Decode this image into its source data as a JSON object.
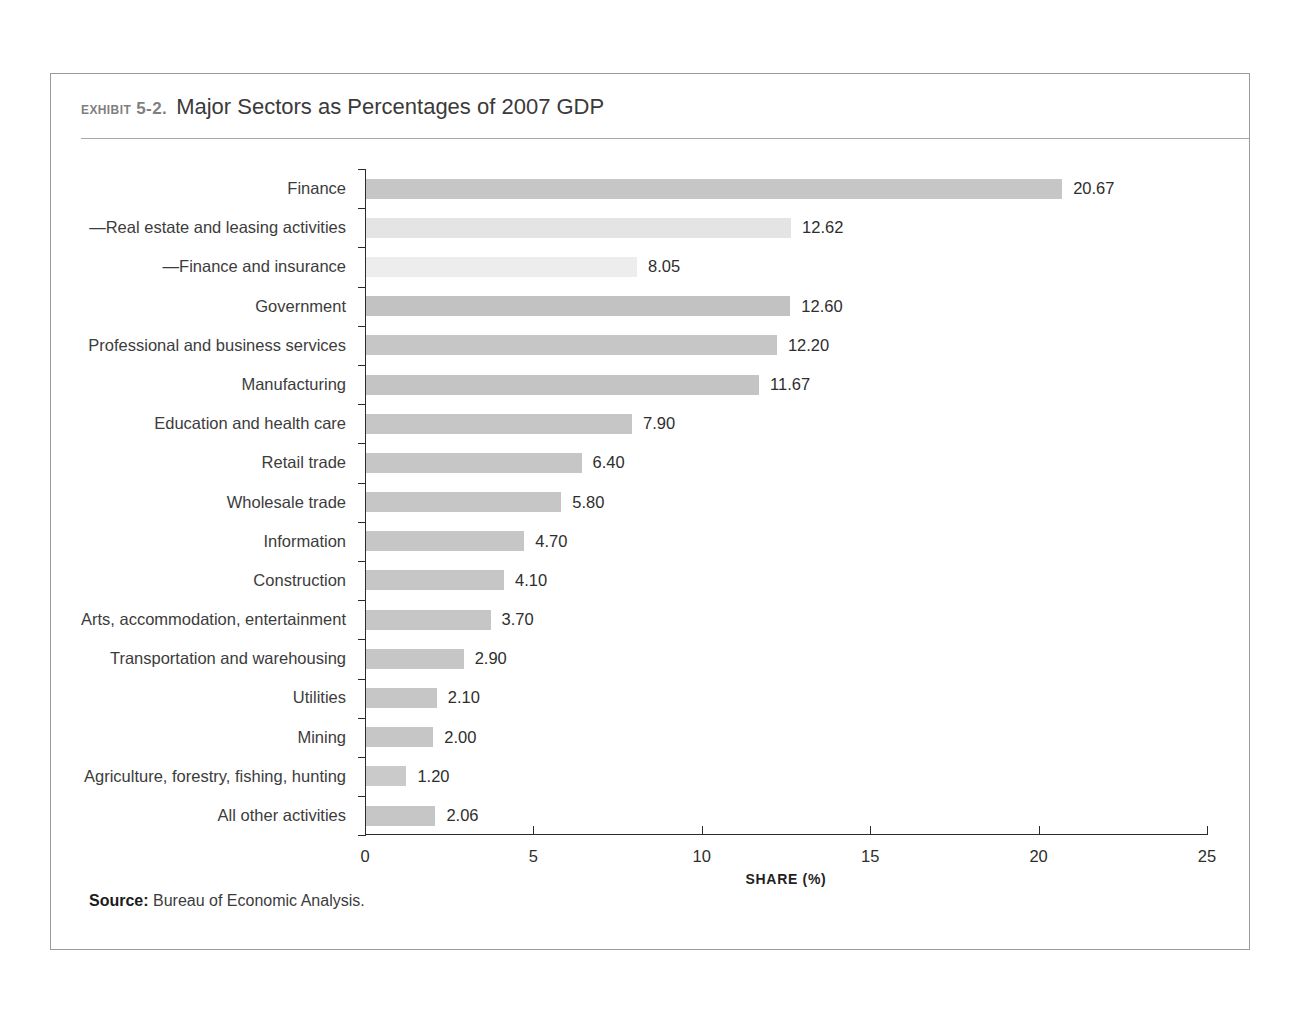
{
  "exhibit": {
    "number": "EXHIBIT 5-2.",
    "title": "Major Sectors as Percentages of 2007 GDP"
  },
  "source": {
    "label": "Source:",
    "text": "Bureau of Economic Analysis."
  },
  "chart_data": {
    "type": "bar",
    "orientation": "horizontal",
    "title": "Major Sectors as Percentages of 2007 GDP",
    "xlabel": "SHARE (%)",
    "ylabel": "",
    "xlim": [
      0,
      25
    ],
    "xticks": [
      "0",
      "5",
      "10",
      "15",
      "20",
      "25"
    ],
    "xtick_values": [
      0,
      5,
      10,
      15,
      20,
      25
    ],
    "grid": false,
    "legend": "none",
    "categories": [
      "Finance",
      "—Real estate and leasing activities",
      "—Finance and insurance",
      "Government",
      "Professional and business services",
      "Manufacturing",
      "Education and health care",
      "Retail trade",
      "Wholesale trade",
      "Information",
      "Construction",
      "Arts, accommodation, entertainment",
      "Transportation and warehousing",
      "Utilities",
      "Mining",
      "Agriculture, forestry, fishing, hunting",
      "All other activities"
    ],
    "values": [
      20.67,
      12.62,
      8.05,
      12.6,
      12.2,
      11.67,
      7.9,
      6.4,
      5.8,
      4.7,
      4.1,
      3.7,
      2.9,
      2.1,
      2.0,
      1.2,
      2.06
    ],
    "value_labels": [
      "20.67",
      "12.62",
      "8.05",
      "12.60",
      "12.20",
      "11.67",
      "7.90",
      "6.40",
      "5.80",
      "4.70",
      "4.10",
      "3.70",
      "2.90",
      "2.10",
      "2.00",
      "1.20",
      "2.06"
    ],
    "bar_colors": [
      "#c6c6c6",
      "#e4e4e4",
      "#ededed",
      "#c2c2c2",
      "#c6c6c6",
      "#c4c4c4",
      "#c6c6c6",
      "#c6c6c6",
      "#c6c6c6",
      "#c6c6c6",
      "#c6c6c6",
      "#c6c6c6",
      "#c6c6c6",
      "#c6c6c6",
      "#c6c6c6",
      "#cacaca",
      "#c6c6c6"
    ],
    "colors": {
      "bar_primary": "#c6c6c6",
      "bar_sub_light": "#e4e4e4",
      "bar_sub_lighter": "#ededed",
      "axis": "#2b2b2b",
      "frame": "#9a9a9a",
      "text": "#3c3c3c",
      "exhibit_number": "#7f7f7f"
    }
  }
}
